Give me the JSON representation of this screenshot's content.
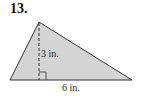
{
  "problem": {
    "number": "13.",
    "height_label": "3 in.",
    "base_label": "6 in."
  },
  "colors": {
    "fill": "#d4d4d4",
    "stroke": "#333333"
  }
}
